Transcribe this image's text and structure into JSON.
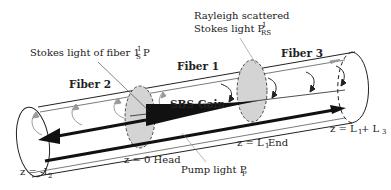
{
  "diagram": {
    "type": "fiber-sbs-schematic",
    "labels": {
      "fiber1": "Fiber 1",
      "fiber2": "Fiber 2",
      "fiber3": "Fiber 3",
      "sbs_gain": "SBS Gain",
      "stokes_main": "Stokes light of fiber 1 P",
      "stokes_sub": "S",
      "stokes_sup": "1",
      "rayleigh_line1": "Rayleigh scattered",
      "rayleigh_line2_main": "Stokes light P",
      "rayleigh_sub": "RS",
      "rayleigh_sup": "1",
      "pump_main": "Pump light P",
      "pump_sub": "P",
      "head_label": "z = 0 Head",
      "end_main": "z = L",
      "end_sub": "1",
      "end_suffix": " End",
      "left_main": "z = -L",
      "left_sub": "2",
      "right_main": "z = L",
      "right_sub1": "1",
      "right_mid": " + L",
      "right_sub3": "3"
    },
    "colors": {
      "line": "#222222",
      "disk_fill": "#d4d4d4",
      "arrow_gray": "#9a9a9a",
      "background": "#ffffff"
    }
  }
}
